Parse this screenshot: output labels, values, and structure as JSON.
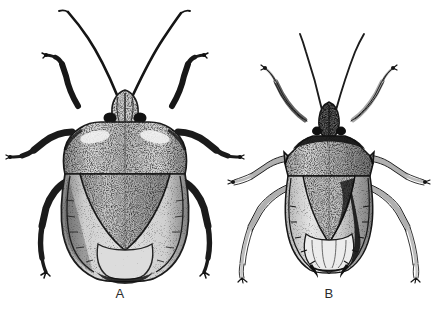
{
  "figure": {
    "type": "scientific-illustration",
    "background_color": "#ffffff",
    "ink_color": "#1a1a1a",
    "width": 432,
    "height": 313,
    "panels": [
      {
        "label": "A",
        "position": "left",
        "description": "larger, broad-shouldered stink bug with heavy dark stippling, thick dark legs and dark antennae",
        "body_center_x": 120,
        "body_top_y": 86,
        "body_bottom_y": 282,
        "body_width": 128,
        "shading": "dark",
        "leg_style": "thick-dark",
        "antenna_count": 2,
        "leg_count": 6
      },
      {
        "label": "B",
        "position": "right",
        "description": "narrower, smaller stink bug with lighter stippling, slender pale legs and fine antennae",
        "body_center_x": 328,
        "body_top_y": 96,
        "body_bottom_y": 272,
        "body_width": 84,
        "shading": "light",
        "leg_style": "thin-pale",
        "antenna_count": 2,
        "leg_count": 6
      }
    ]
  },
  "captions": {
    "a": "A",
    "b": "B"
  }
}
